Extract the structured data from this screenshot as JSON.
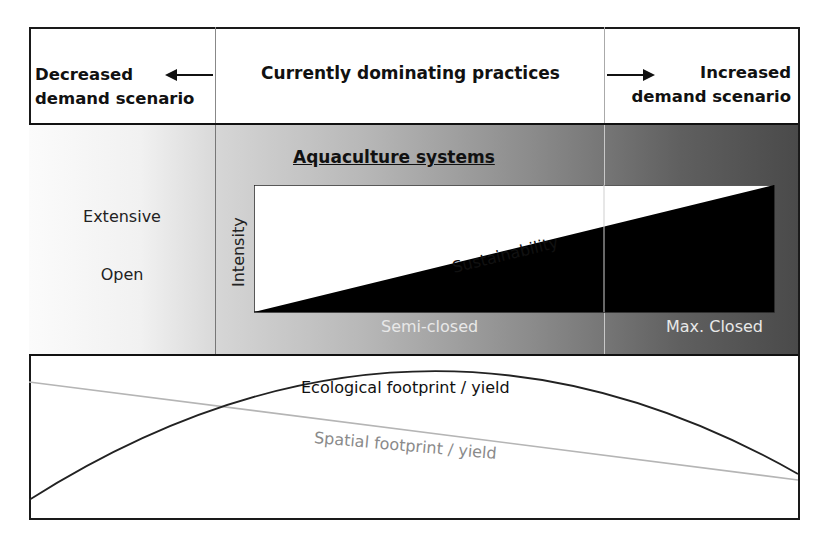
{
  "header": {
    "left": {
      "line1": "Decreased",
      "line2": "demand scenario",
      "arrow": "arrow-left"
    },
    "middle": {
      "title": "Currently dominating practices"
    },
    "right": {
      "line1": "Increased",
      "line2": "demand scenario",
      "arrow": "arrow-right"
    }
  },
  "middle_band": {
    "left_labels": [
      "Extensive",
      "Open"
    ],
    "section_title": "Aquaculture systems",
    "y_axis_label": "Intensity",
    "diagonal_label": "Sustainability",
    "x_labels": [
      "Semi-closed",
      "Max. Closed"
    ]
  },
  "bottom_panel": {
    "curve_label": "Ecological footprint / yield",
    "line_label": "Spatial footprint / yield"
  },
  "colors": {
    "border": "#1a1a1a",
    "triangle": "#000000",
    "spatial_line": "#b0b0b0",
    "gradient_light": "#d6d6d6",
    "gradient_dark": "#4a4a4a"
  }
}
